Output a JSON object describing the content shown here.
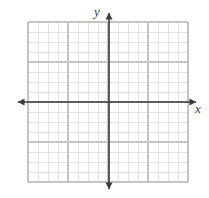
{
  "figure": {
    "title": "",
    "type": "coordinate-plane",
    "width": 209,
    "height": 198,
    "background_color": "#ffffff"
  },
  "grid": {
    "left": 28,
    "top": 22,
    "right": 188,
    "bottom": 182,
    "cell_size": 10,
    "columns": 16,
    "rows": 16,
    "minor_line_color": "#dcdcdc",
    "major_line_color": "#c4c4c4",
    "major_every": 4,
    "show_grid": true
  },
  "axes": {
    "color": "#3a3a3a",
    "stroke_width": 1.6,
    "x_axis": {
      "label": "x",
      "y_position": 102,
      "start_x": 18,
      "end_x": 196,
      "arrow_left": true,
      "arrow_right": true,
      "label_x": 198,
      "label_y": 113
    },
    "y_axis": {
      "label": "y",
      "x_position": 109,
      "start_y": 13,
      "end_y": 189,
      "arrow_top": true,
      "arrow_bottom": true,
      "label_x": 97,
      "label_y": 16
    },
    "origin": {
      "x": 109,
      "y": 102
    },
    "tick_labels": [],
    "show_numbers": false
  },
  "chart_data": {
    "type": "scatter",
    "title": "",
    "xlabel": "x",
    "ylabel": "y",
    "xlim": [
      -8,
      8
    ],
    "ylim": [
      -8,
      8
    ],
    "x_tick_step": 1,
    "y_tick_step": 1,
    "grid": true,
    "legend": null,
    "series": [
      {
        "name": "",
        "x": [],
        "y": []
      }
    ],
    "annotations": []
  }
}
